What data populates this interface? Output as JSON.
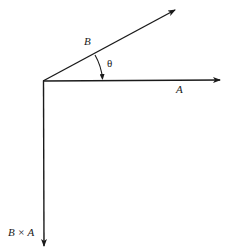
{
  "diagram": {
    "type": "vector-cross-product",
    "origin": [
      43,
      81
    ],
    "stroke_color": "#1a1a1a",
    "vectors": [
      {
        "id": "A",
        "label": "A",
        "tip": [
          220,
          80
        ],
        "label_pos": [
          176,
          93
        ]
      },
      {
        "id": "B",
        "label": "B",
        "tip": [
          175,
          10
        ],
        "label_pos": [
          84,
          45
        ]
      },
      {
        "id": "BxA",
        "label": "B × A",
        "tip": [
          44,
          246
        ],
        "label_pos": [
          8,
          236
        ]
      }
    ],
    "angle": {
      "label": "θ",
      "from": "B",
      "to": "A",
      "label_pos": [
        107,
        67
      ]
    }
  }
}
